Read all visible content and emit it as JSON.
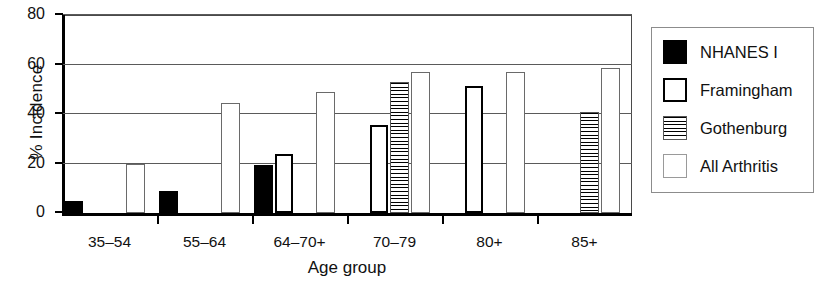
{
  "chart_data": {
    "type": "bar",
    "title": "",
    "xlabel": "Age group",
    "ylabel": "% Incidence",
    "categories": [
      "35–54",
      "55–64",
      "64–70+",
      "70–79",
      "80+",
      "85+"
    ],
    "ylim": [
      0,
      80
    ],
    "yticks": [
      0,
      20,
      40,
      60,
      80
    ],
    "ytick_labels": [
      "0",
      "20",
      "40",
      "60",
      "80"
    ],
    "grid": true,
    "legend_position": "right-outside",
    "series": [
      {
        "name": "NHANES I",
        "style": "solid-black",
        "color": "#000000",
        "values": [
          5,
          9,
          19.5,
          null,
          null,
          null
        ]
      },
      {
        "name": "Framingham",
        "style": "white-thick-border",
        "color": "#ffffff",
        "values": [
          null,
          null,
          24,
          35.5,
          51.5,
          null
        ]
      },
      {
        "name": "Gothenburg",
        "style": "horizontal-hatch",
        "color": "#ffffff",
        "values": [
          null,
          null,
          null,
          53,
          null,
          41
        ]
      },
      {
        "name": "All Arthritis",
        "style": "white-thin-border",
        "color": "#ffffff",
        "values": [
          19.8,
          44.5,
          49,
          57,
          57,
          58.5
        ]
      }
    ]
  },
  "legend": {
    "items": [
      {
        "label": "NHANES I",
        "swatch": "nhanes"
      },
      {
        "label": "Framingham",
        "swatch": "framingham"
      },
      {
        "label": "Gothenburg",
        "swatch": "gothenburg"
      },
      {
        "label": "All Arthritis",
        "swatch": "allarthritis"
      }
    ]
  }
}
